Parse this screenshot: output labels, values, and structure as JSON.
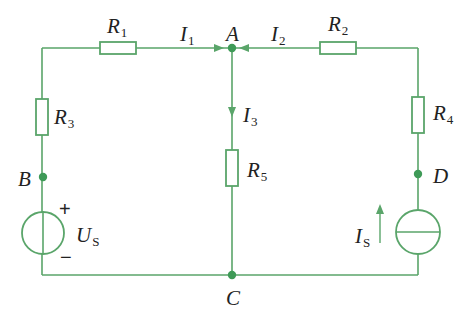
{
  "colors": {
    "wire": "#5aa56a",
    "node": "#3e9a57",
    "text": "#222222",
    "background": "#ffffff"
  },
  "circuit": {
    "resistors": [
      {
        "id": "R1",
        "letter": "R",
        "sub": "1",
        "branch": "top-left"
      },
      {
        "id": "R2",
        "letter": "R",
        "sub": "2",
        "branch": "top-right"
      },
      {
        "id": "R3",
        "letter": "R",
        "sub": "3",
        "branch": "left"
      },
      {
        "id": "R4",
        "letter": "R",
        "sub": "4",
        "branch": "right"
      },
      {
        "id": "R5",
        "letter": "R",
        "sub": "5",
        "branch": "middle"
      }
    ],
    "currents": [
      {
        "id": "I1",
        "letter": "I",
        "sub": "1",
        "direction": "right, into A"
      },
      {
        "id": "I2",
        "letter": "I",
        "sub": "2",
        "direction": "left, into A"
      },
      {
        "id": "I3",
        "letter": "I",
        "sub": "3",
        "direction": "down, out of A"
      }
    ],
    "nodes": [
      {
        "id": "A",
        "label": "A"
      },
      {
        "id": "B",
        "label": "B"
      },
      {
        "id": "C",
        "label": "C"
      },
      {
        "id": "D",
        "label": "D"
      }
    ],
    "sources": {
      "voltage": {
        "letter": "U",
        "sub": "S",
        "plus": "+",
        "minus": "−",
        "type": "voltage-source"
      },
      "current": {
        "letter": "I",
        "sub": "S",
        "arrow": "up",
        "type": "current-source"
      }
    }
  }
}
